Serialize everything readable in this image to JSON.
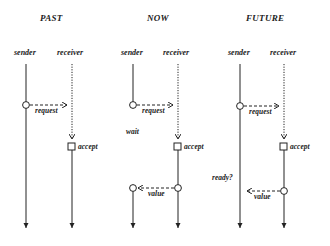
{
  "colors": {
    "ink": "#222222",
    "background": "#ffffff"
  },
  "panels": [
    {
      "title": "PAST",
      "sender_label": "sender",
      "receiver_label": "receiver",
      "messages": [
        {
          "label": "request",
          "direction": "sender-to-receiver",
          "style": "dashed"
        }
      ],
      "events": [
        {
          "label": "accept",
          "actor": "receiver",
          "marker": "square"
        }
      ]
    },
    {
      "title": "NOW",
      "sender_label": "sender",
      "receiver_label": "receiver",
      "messages": [
        {
          "label": "request",
          "direction": "sender-to-receiver",
          "style": "dashed"
        },
        {
          "label": "value",
          "direction": "receiver-to-sender",
          "style": "dashed"
        }
      ],
      "events": [
        {
          "label": "wait",
          "actor": "sender",
          "marker": "none"
        },
        {
          "label": "accept",
          "actor": "receiver",
          "marker": "square"
        }
      ]
    },
    {
      "title": "FUTURE",
      "sender_label": "sender",
      "receiver_label": "receiver",
      "messages": [
        {
          "label": "request",
          "direction": "sender-to-receiver",
          "style": "dashed"
        },
        {
          "label": "value",
          "direction": "receiver-to-sender",
          "style": "dashed"
        }
      ],
      "events": [
        {
          "label": "accept",
          "actor": "receiver",
          "marker": "square"
        },
        {
          "label": "ready?",
          "actor": "sender",
          "marker": "none"
        }
      ]
    }
  ]
}
